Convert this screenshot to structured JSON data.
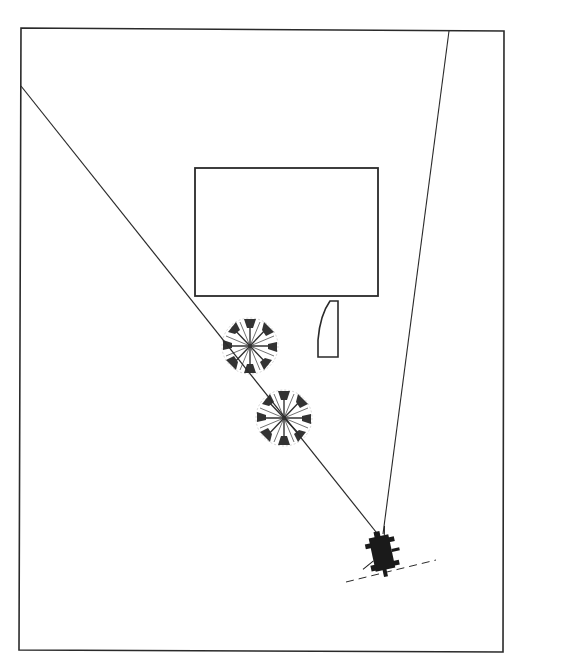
{
  "diagram": {
    "type": "plan-view sight-line diagram",
    "colors": {
      "background": "#ffffff",
      "stroke": "#2a2a2a",
      "figure": "#1a1a1a",
      "tree": "#333333"
    },
    "frame": {
      "x1": 21,
      "y1": 28,
      "x2": 504,
      "y2": 31,
      "x3": 503,
      "y3": 652,
      "x4": 19,
      "y4": 650
    },
    "building": {
      "x": 195,
      "y": 168,
      "w": 183,
      "h": 128
    },
    "small_structure": {
      "x": 318,
      "y": 300,
      "w": 20,
      "h": 57
    },
    "trees": [
      {
        "cx": 250,
        "cy": 346,
        "r": 28
      },
      {
        "cx": 284,
        "cy": 418,
        "r": 28
      }
    ],
    "observer": {
      "x": 382,
      "y": 548
    },
    "sight_lines": [
      {
        "from": [
          380,
          537
        ],
        "to": [
          21,
          86
        ]
      },
      {
        "from": [
          383,
          534
        ],
        "to": [
          449,
          31
        ]
      }
    ],
    "dashed_line": {
      "from": [
        346,
        582
      ],
      "to": [
        436,
        560
      ]
    }
  }
}
